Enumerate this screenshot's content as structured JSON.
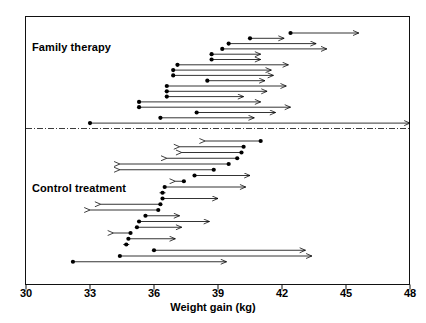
{
  "chart_data": {
    "type": "scatter",
    "title": "",
    "xlabel": "Weight gain (kg)",
    "ylabel": "",
    "xlim": [
      30,
      48
    ],
    "xticks": [
      30,
      33,
      36,
      39,
      42,
      45,
      48
    ],
    "xticklabels": [
      "30",
      "33",
      "36",
      "39",
      "42",
      "45",
      "48"
    ],
    "grid": false,
    "legend": false,
    "annotations": [
      {
        "text": "Family therapy",
        "x": 30.4,
        "row": 1
      },
      {
        "text": "Control treatment",
        "x": 30.4,
        "row": 20
      }
    ],
    "groups": [
      {
        "name": "Family therapy",
        "label": "Family therapy",
        "series": [
          {
            "index": 1,
            "start": 42.4,
            "end": 45.6,
            "direction": "right"
          },
          {
            "index": 2,
            "start": 40.5,
            "end": 42.1,
            "direction": "right"
          },
          {
            "index": 3,
            "start": 39.5,
            "end": 43.6,
            "direction": "right"
          },
          {
            "index": 4,
            "start": 39.2,
            "end": 44.1,
            "direction": "right"
          },
          {
            "index": 5,
            "start": 38.7,
            "end": 41.0,
            "direction": "right"
          },
          {
            "index": 6,
            "start": 38.7,
            "end": 41.0,
            "direction": "right"
          },
          {
            "index": 7,
            "start": 37.1,
            "end": 42.3,
            "direction": "right"
          },
          {
            "index": 8,
            "start": 36.9,
            "end": 41.5,
            "direction": "right"
          },
          {
            "index": 9,
            "start": 36.9,
            "end": 41.6,
            "direction": "right"
          },
          {
            "index": 10,
            "start": 38.5,
            "end": 41.2,
            "direction": "right"
          },
          {
            "index": 11,
            "start": 36.6,
            "end": 42.2,
            "direction": "right"
          },
          {
            "index": 12,
            "start": 36.6,
            "end": 41.3,
            "direction": "right"
          },
          {
            "index": 13,
            "start": 36.6,
            "end": 40.2,
            "direction": "right"
          },
          {
            "index": 14,
            "start": 35.3,
            "end": 41.0,
            "direction": "right"
          },
          {
            "index": 15,
            "start": 35.3,
            "end": 42.4,
            "direction": "right"
          },
          {
            "index": 16,
            "start": 38.0,
            "end": 41.7,
            "direction": "right"
          },
          {
            "index": 17,
            "start": 36.3,
            "end": 40.7,
            "direction": "right"
          },
          {
            "index": 18,
            "start": 33.0,
            "end": 48.0,
            "direction": "right"
          }
        ]
      },
      {
        "name": "Control treatment",
        "label": "Control treatment",
        "series": [
          {
            "index": 1,
            "start": 41.0,
            "end": 38.4,
            "direction": "left"
          },
          {
            "index": 2,
            "start": 40.2,
            "end": 37.2,
            "direction": "left"
          },
          {
            "index": 3,
            "start": 40.1,
            "end": 37.3,
            "direction": "left"
          },
          {
            "index": 4,
            "start": 39.9,
            "end": 36.6,
            "direction": "left"
          },
          {
            "index": 5,
            "start": 39.5,
            "end": 34.4,
            "direction": "left"
          },
          {
            "index": 6,
            "start": 38.8,
            "end": 34.4,
            "direction": "left"
          },
          {
            "index": 7,
            "start": 37.9,
            "end": 40.5,
            "direction": "right"
          },
          {
            "index": 8,
            "start": 37.4,
            "end": 37.0,
            "direction": "left"
          },
          {
            "index": 9,
            "start": 36.5,
            "end": 40.3,
            "direction": "right"
          },
          {
            "index": 10,
            "start": 36.4,
            "end": 36.3,
            "direction": "left"
          },
          {
            "index": 11,
            "start": 36.4,
            "end": 39.0,
            "direction": "right"
          },
          {
            "index": 12,
            "start": 36.3,
            "end": 33.5,
            "direction": "left"
          },
          {
            "index": 13,
            "start": 36.2,
            "end": 33.0,
            "direction": "left"
          },
          {
            "index": 14,
            "start": 35.6,
            "end": 37.2,
            "direction": "right"
          },
          {
            "index": 15,
            "start": 35.3,
            "end": 38.6,
            "direction": "right"
          },
          {
            "index": 16,
            "start": 35.2,
            "end": 37.3,
            "direction": "right"
          },
          {
            "index": 17,
            "start": 34.9,
            "end": 34.1,
            "direction": "left"
          },
          {
            "index": 18,
            "start": 34.8,
            "end": 37.0,
            "direction": "right"
          },
          {
            "index": 19,
            "start": 34.7,
            "end": 34.6,
            "direction": "left"
          },
          {
            "index": 20,
            "start": 36.0,
            "end": 43.1,
            "direction": "right"
          },
          {
            "index": 21,
            "start": 34.4,
            "end": 43.4,
            "direction": "right"
          },
          {
            "index": 22,
            "start": 32.2,
            "end": 39.4,
            "direction": "right"
          }
        ]
      }
    ],
    "divider": {
      "type": "dash-dot-horizontal",
      "position": "between-groups"
    },
    "style": {
      "marker": "filled-circle",
      "line": "solid-with-arrowhead",
      "color": "#000000"
    }
  }
}
